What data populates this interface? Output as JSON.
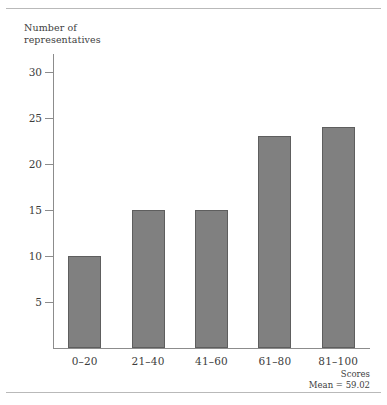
{
  "figure": {
    "axis_title_y": "Number of\nrepresentatives",
    "annotation_axis_x": "Scores",
    "annotation_mean": "Mean = 59.02",
    "bar_color": "#808080",
    "bar_edge_color": "#5e5e5e",
    "axis_color": "#8c8c8c",
    "rule_color": "#b9b9b9",
    "text_color": "#3d3d3d"
  },
  "chart_data": {
    "type": "bar",
    "title": "",
    "subtitle": "",
    "xlabel": "Scores",
    "ylabel": "Number of representatives",
    "categories": [
      "0–20",
      "21–40",
      "41–60",
      "61–80",
      "81–100"
    ],
    "values": [
      10,
      15,
      15,
      23,
      24
    ],
    "series": [
      {
        "name": "Number of representatives",
        "values": [
          10,
          15,
          15,
          23,
          24
        ]
      }
    ],
    "ylim": [
      0,
      31
    ],
    "yticks": [
      5,
      10,
      15,
      20,
      25,
      30
    ],
    "ytick_labels": [
      "5",
      "10",
      "15",
      "20",
      "25",
      "30"
    ],
    "grid": false,
    "legend": false,
    "legend_position": "none",
    "annotations": [
      "Scores",
      "Mean = 59.02"
    ],
    "mean": 59.02
  }
}
